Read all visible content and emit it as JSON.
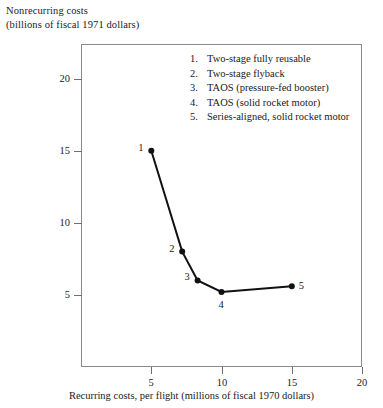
{
  "chart_data": {
    "type": "line",
    "title": "",
    "ylabel_line1": "Nonrecurring costs",
    "ylabel_line2": "(billions of fiscal 1971 dollars)",
    "xlabel": "Recurring costs, per flight (millions of fiscal 1970 dollars)",
    "xlim": [
      0,
      20
    ],
    "ylim": [
      0,
      22.4
    ],
    "xticks": [
      5,
      10,
      15,
      20
    ],
    "yticks": [
      5,
      10,
      15,
      20
    ],
    "grid": false,
    "legend_position": "inside-top-right",
    "marker": "filled-circle",
    "line_color": "#111111",
    "points": [
      {
        "id": "1",
        "x": 5.0,
        "y": 15.0,
        "label": "1",
        "label_pos": "left",
        "name": "Two-stage fully reusable"
      },
      {
        "id": "2",
        "x": 7.2,
        "y": 8.0,
        "label": "2",
        "label_pos": "left",
        "name": "Two-stage flyback"
      },
      {
        "id": "3",
        "x": 8.3,
        "y": 6.0,
        "label": "3",
        "label_pos": "left",
        "name": "TAOS (pressure-fed booster)"
      },
      {
        "id": "4",
        "x": 10.0,
        "y": 5.2,
        "label": "4",
        "label_pos": "below",
        "name": "TAOS (solid rocket motor)"
      },
      {
        "id": "5",
        "x": 15.0,
        "y": 5.6,
        "label": "5",
        "label_pos": "right",
        "name": "Series-aligned, solid rocket motor"
      }
    ],
    "legend": [
      {
        "num": "1.",
        "text": "Two-stage fully reusable"
      },
      {
        "num": "2.",
        "text": "Two-stage flyback"
      },
      {
        "num": "3.",
        "text": "TAOS (pressure-fed booster)"
      },
      {
        "num": "4.",
        "text": "TAOS (solid rocket motor)"
      },
      {
        "num": "5.",
        "text": "Series-aligned, solid rocket motor"
      }
    ]
  }
}
